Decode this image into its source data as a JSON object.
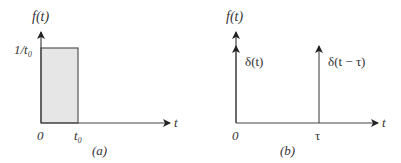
{
  "panels": [
    {
      "id": "a",
      "caption": "(a)",
      "y_axis_label": "f(t)",
      "x_axis_label": "t",
      "height_label": "1/t₀",
      "origin_label": "0",
      "width_label": "t₀",
      "shape": "rectangular pulse",
      "fill_color": "#e6e6e6"
    },
    {
      "id": "b",
      "caption": "(b)",
      "y_axis_label": "f(t)",
      "x_axis_label": "t",
      "origin_label": "0",
      "shift_label": "τ",
      "impulse_1_label": "δ(t)",
      "impulse_2_label": "δ(t − τ)",
      "shape": "unit impulses"
    }
  ]
}
